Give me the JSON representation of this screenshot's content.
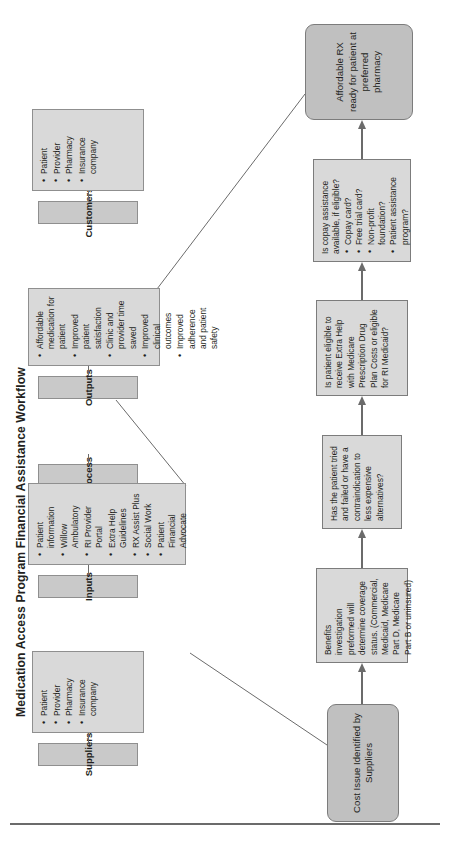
{
  "title": "Medication Access Program Financial Assistance Workflow",
  "sipoc": {
    "columns": [
      {
        "header": "Suppliers",
        "items": [
          "Patient",
          "Provider",
          "Pharmacy",
          "Insurance company"
        ]
      },
      {
        "header": "Inputs",
        "items": [
          "Patient information",
          "Willow Ambulatory",
          "RI Provider Portal",
          "Extra Help Guidelines",
          "RX Assist Plus",
          "Social Work",
          "Patient Financial Advocate"
        ]
      },
      {
        "header": "Process",
        "items": []
      },
      {
        "header": "Outputs",
        "items": [
          "Affordable medication for patient",
          "Improved patient satisfaction",
          "Clinic and provider time saved",
          "Improved clinical outcomes",
          "Improved adherence and patient safety"
        ]
      },
      {
        "header": "Customers",
        "items": [
          "Patient",
          "Provider",
          "Pharmacy",
          "Insurance company"
        ]
      }
    ]
  },
  "flow": {
    "start": {
      "label": "Cost Issue Identified by Suppliers"
    },
    "step_benefits": {
      "text": "Benefits investigation preformed will determine coverage status. (Commercial, Medicaid, Medicare Part D, Medicare Part B or uninsured)"
    },
    "step_tried_failed": {
      "text": "Has the patient tried and failed or have a contraindication to less expensive alternatives?"
    },
    "step_extra_help": {
      "text": "Is patient eligible to receive Extra Help with Medicare Prescription Drug Plan Costs or eligible for RI Medicaid?"
    },
    "step_copay": {
      "text": "Is copay assistance available, if eligible?",
      "items": [
        "Copay card?",
        "Free trial card?",
        "Non-profit foundation?",
        "Patient assistance program?"
      ]
    },
    "end": {
      "label": "Affordable RX ready for patient at preferred pharmacy"
    }
  },
  "colors": {
    "header_fill": "#c9c9c9",
    "card_fill": "#d9d9d9",
    "terminator_fill": "#c0c0c0",
    "stroke": "#7c7c7c",
    "text": "#231f20"
  }
}
